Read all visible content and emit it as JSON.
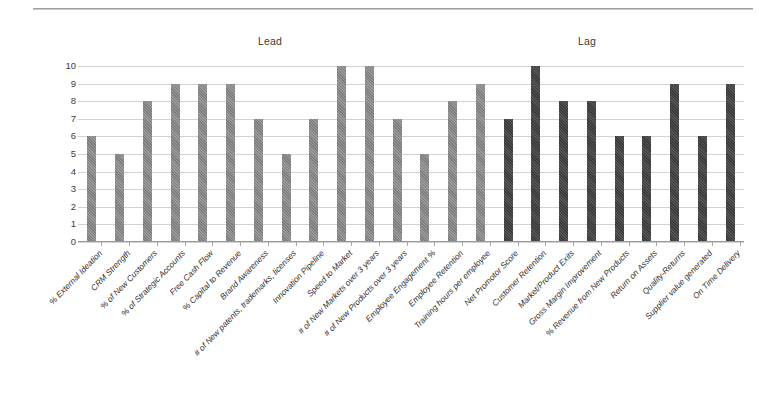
{
  "chart_data": {
    "type": "bar",
    "title": "",
    "xlabel": "",
    "ylabel": "",
    "ylim": [
      0,
      10
    ],
    "ytick_labels": [
      "10",
      "9",
      "8",
      "7",
      "6",
      "5",
      "4",
      "3",
      "2",
      "1",
      "0"
    ],
    "yticks": [
      10,
      9,
      8,
      7,
      6,
      5,
      4,
      3,
      2,
      1,
      0
    ],
    "grid": true,
    "legend_position": "none",
    "group_headings": [
      {
        "label": "Lead",
        "x_fraction": 0.29
      },
      {
        "label": "Lag",
        "x_fraction": 0.76
      }
    ],
    "categories": [
      "% External Ideation",
      "CRM Strength",
      "% of New Customers",
      "% of Strategic Accounts",
      "Free Cash Flow",
      "% Capital to Revenue",
      "Brand Awareness",
      "# of New patents, trademarks, licenses",
      "Innovation Pipeline",
      "Speed to Market",
      "# of New Markets over 3 years",
      "# of New Products over 3 years",
      "Employee Engagement %",
      "Employee Retention",
      "Training hours per employee",
      "Net Promotor Score",
      "Customer Retention",
      "Market/Product Exits",
      "Gross Margin Improvement",
      "% Revenue from New Products",
      "Return on Assets",
      "Quality-Returns",
      "Supplier value generated",
      "On Time Delivery"
    ],
    "values": [
      6,
      5,
      8,
      9,
      9,
      9,
      7,
      5,
      7,
      10,
      10,
      7,
      5,
      8,
      9,
      7,
      10,
      8,
      8,
      6,
      6,
      9,
      6,
      9
    ],
    "series_groups": [
      "lead",
      "lead",
      "lead",
      "lead",
      "lead",
      "lead",
      "lead",
      "lead",
      "lead",
      "lead",
      "lead",
      "lead",
      "lead",
      "lead",
      "lead",
      "lag",
      "lag",
      "lag",
      "lag",
      "lag",
      "lag",
      "lag",
      "lag",
      "lag"
    ],
    "colors": {
      "lead": "#8a8a8a",
      "lag": "#464646",
      "gridline": "#d2d2d2",
      "axis": "#9a9a9a",
      "text": "#2e2e2e"
    }
  }
}
